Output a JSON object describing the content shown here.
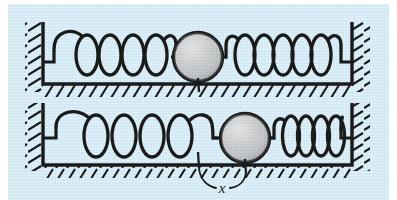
{
  "figure": {
    "background_color": "#cfe8f3",
    "ink_color": "#1a1a1a",
    "ball_color": "#b9bcbe",
    "panels": [
      {
        "id": "top",
        "state_label": "equilibrium",
        "description": "Ball at equilibrium position, both springs at natural length",
        "left_spring": {
          "coils": 4,
          "state": "natural"
        },
        "right_spring": {
          "coils": 7,
          "state": "natural"
        },
        "ball": {
          "center_x": 198,
          "center_y": 57,
          "radius": 25
        }
      },
      {
        "id": "bottom",
        "state_label": "displaced",
        "description": "Ball displaced to the right by x, left spring stretched, right spring compressed",
        "left_spring": {
          "coils": 4,
          "state": "stretched"
        },
        "right_spring": {
          "coils": 7,
          "state": "compressed"
        },
        "ball": {
          "center_x": 245,
          "center_y": 138,
          "radius": 25
        }
      }
    ],
    "annotations": [
      {
        "name": "displacement-label",
        "text": "x",
        "label_x": 222,
        "label_y": 190,
        "from_tick_x": 198,
        "to_tick_x": 245,
        "tick_y": 162
      }
    ]
  }
}
